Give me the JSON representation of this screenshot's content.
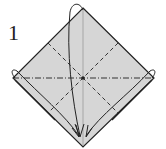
{
  "step": {
    "number": "1"
  },
  "colors": {
    "paper": "#d6d6d6",
    "line": "#222222",
    "background": "#ffffff"
  },
  "diagram": {
    "shape": "square-diamond",
    "lines": [
      "valley-fold-diagonal-left",
      "valley-fold-diagonal-right",
      "mountain-fold-horizontal",
      "valley-fold-vertical"
    ],
    "arrows": [
      "top-corner-to-bottom",
      "left-corner-to-bottom",
      "right-corner-to-bottom"
    ]
  }
}
